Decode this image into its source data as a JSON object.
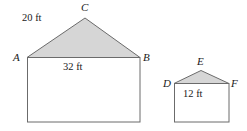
{
  "figure": {
    "colors": {
      "roof_fill": "#d6d6d6",
      "outline": "#6b6b6b",
      "text": "#1a1a1a",
      "background": "#ffffff"
    },
    "shapes": [
      {
        "name": "large-house",
        "roof": {
          "name": "triangle-ABC",
          "vertices": [
            {
              "label": "A",
              "x": 27,
              "y": 57
            },
            {
              "label": "C",
              "x": 85,
              "y": 18
            },
            {
              "label": "B",
              "x": 140,
              "y": 57
            }
          ]
        },
        "body": {
          "name": "rectangle-base",
          "x": 27,
          "y": 57,
          "width": 113,
          "height": 65
        },
        "dimensions": [
          {
            "label": "20 ft",
            "side": "AC"
          },
          {
            "label": "32 ft",
            "side": "AB"
          }
        ]
      },
      {
        "name": "small-house",
        "roof": {
          "name": "triangle-DEF",
          "vertices": [
            {
              "label": "D",
              "x": 174,
              "y": 83
            },
            {
              "label": "E",
              "x": 201,
              "y": 71
            },
            {
              "label": "F",
              "x": 229,
              "y": 83
            }
          ]
        },
        "body": {
          "name": "rectangle-base",
          "x": 174,
          "y": 83,
          "width": 55,
          "height": 39
        },
        "dimensions": [
          {
            "label": "12 ft",
            "side": "DF"
          }
        ]
      }
    ],
    "labels": {
      "A": "A",
      "B": "B",
      "C": "C",
      "D": "D",
      "E": "E",
      "F": "F",
      "large_slant": "20 ft",
      "large_base": "32 ft",
      "small_base": "12 ft"
    }
  }
}
